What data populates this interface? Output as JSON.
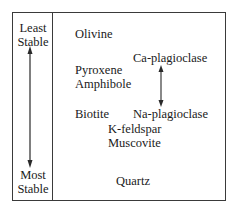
{
  "left_column": {
    "top_label": [
      "Least",
      "Stable"
    ],
    "bottom_label": [
      "Most",
      "Stable"
    ]
  },
  "minerals": {
    "olivine": "Olivine",
    "pyroxene": "Pyroxene",
    "amphibole": "Amphibole",
    "biotite": "Biotite",
    "k_feldspar": "K-feldspar",
    "muscovite": "Muscovite",
    "quartz": "Quartz",
    "ca_plagioclase": "Ca-plagioclase",
    "na_plagioclase": "Na-plagioclase"
  },
  "colors": {
    "line": "#3a3a3a",
    "text": "#1a1a1a",
    "background": "#ffffff"
  }
}
